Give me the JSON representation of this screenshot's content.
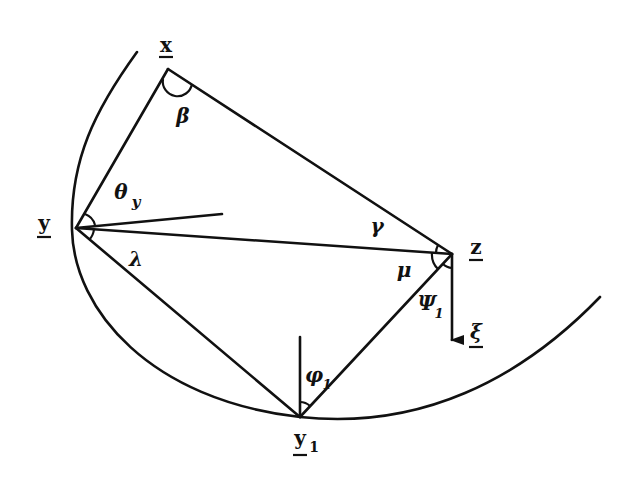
{
  "diagram": {
    "points": {
      "x": {
        "label": "x",
        "underline": true
      },
      "y": {
        "label": "y",
        "underline": true
      },
      "z": {
        "label": "z",
        "underline": true
      },
      "y1": {
        "label": "y",
        "subscript": "1",
        "underline": true
      }
    },
    "vector": {
      "label": "ξ",
      "underline": true
    },
    "angles": {
      "beta": "β",
      "gamma": "γ",
      "theta": "θ",
      "theta_sub": "y",
      "lambda": "λ",
      "mu": "μ",
      "psi": "Ψ",
      "psi_sub": "1",
      "phi": "φ",
      "phi_sub": "1"
    }
  }
}
